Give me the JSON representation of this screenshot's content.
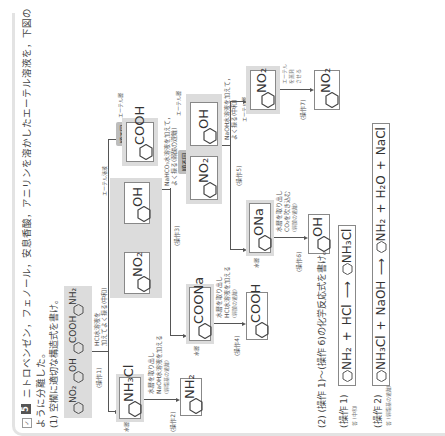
{
  "problem": {
    "number": "5",
    "checkbox_icon": "check-box-icon",
    "intro_line1": "ニトロベンゼン，フェノール，安息香酸，アニリンを溶かしたエーテル溶液を，下図の",
    "intro_line2": "ように分離した。",
    "q1": "(1) 空欄に適切な構造式を書け。",
    "q2": "(2) (操作 1)〜(操作 6)の化学反応式を書け。"
  },
  "mixture": {
    "label": "エーテル溶液",
    "compounds": [
      {
        "group": "NO₂"
      },
      {
        "group": "OH"
      },
      {
        "group": "COOH"
      },
      {
        "group": "NH₂"
      }
    ]
  },
  "operations": {
    "op1": {
      "label": "(操作1)",
      "desc1": "HCl水溶液を",
      "desc2": "加えてよく振る(中和)"
    },
    "op2": {
      "label": "(操作2)",
      "desc1": "水層を取り出し",
      "desc2": "NaOH水溶液を加える",
      "desc3": "(弱塩基の遊離)"
    },
    "op3": {
      "label": "(操作3)",
      "desc1": "NaHCO₃水溶液を加えて，",
      "desc2": "よく振る(弱酸の遊離)"
    },
    "op4": {
      "label": "(操作4)",
      "desc1": "水層を取り出し",
      "desc2": "HCl水溶液を加える",
      "desc3": "(弱酸の遊離)"
    },
    "op5": {
      "label": "(操作5)",
      "desc1": "NaOH水溶液を加えて，",
      "desc2": "よく振る(中和)"
    },
    "op6": {
      "label": "(操作6)",
      "desc1": "水層を取り出し",
      "desc2": "CO₂を吹き込む",
      "desc3": "(弱酸の遊離)"
    },
    "op7": {
      "label": "(操作7)",
      "desc1": "エーテル",
      "desc2": "を蒸発",
      "desc3": "させる"
    }
  },
  "layers": {
    "water": "水層",
    "ether": "エーテル層",
    "funnel": "順不同"
  },
  "answers": {
    "a_nh3cl": "NH₃Cl",
    "a_nh2": "NH₂",
    "a_no2_1": "NO₂",
    "a_oh_1": "OH",
    "a_cooh_1": "COOH",
    "a_coona": "COONa",
    "a_cooh_2": "COOH",
    "a_no2_2": "NO₂",
    "a_ona": "ONa",
    "a_oh_2": "OH",
    "a_no2_3": "NO₂"
  },
  "equations": [
    {
      "label": "(操作 1)",
      "mark": "答",
      "mark_note": "(中和)",
      "lhs1": "NH₂",
      "plus1": "+",
      "lhs2": "HCl",
      "arrow": "⟶",
      "rhs1": "NH₃Cl"
    },
    {
      "label": "(操作 2)",
      "mark": "答",
      "mark_note": "(弱塩基の遊離)",
      "lhs1": "NH₃Cl",
      "plus1": "+",
      "lhs2": "NaOH",
      "arrow": "⟶",
      "rhs1": "NH₂",
      "plus2": "+",
      "rhs2": "H₂O",
      "plus3": "+",
      "rhs3": "NaCl"
    }
  ]
}
